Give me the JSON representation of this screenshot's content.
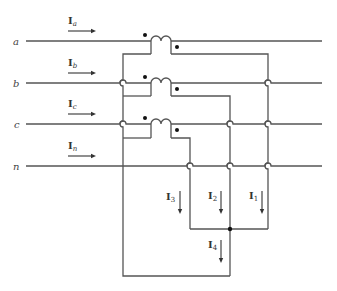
{
  "diagram": {
    "lines": [
      {
        "id": "a",
        "label": "a",
        "y": 41,
        "current": "I",
        "sub": "a"
      },
      {
        "id": "b",
        "label": "b",
        "y": 83,
        "current": "I",
        "sub": "b"
      },
      {
        "id": "c",
        "label": "c",
        "y": 124,
        "current": "I",
        "sub": "c"
      },
      {
        "id": "n",
        "label": "n",
        "y": 166,
        "current": "I",
        "sub": "n"
      }
    ],
    "branch_currents": [
      {
        "id": "I3",
        "main": "I",
        "sub": "3"
      },
      {
        "id": "I2",
        "main": "I",
        "sub": "2"
      },
      {
        "id": "I1",
        "main": "I",
        "sub": "1"
      },
      {
        "id": "I4",
        "main": "I",
        "sub": "4"
      }
    ],
    "colors": {
      "wire": "#555555",
      "dot": "#111111",
      "background": "#ffffff"
    }
  }
}
